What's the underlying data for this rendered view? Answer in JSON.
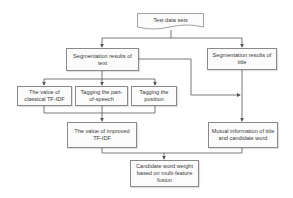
{
  "diagram": {
    "type": "flowchart",
    "nodes": {
      "test_data": {
        "label": "Test data sets",
        "shape": "document"
      },
      "seg_text": {
        "label": "Segmentation results of text"
      },
      "seg_title": {
        "label": "Segmentation results of title"
      },
      "classical_tfidf": {
        "label": "The value of classical TF-IDF"
      },
      "pos_tag": {
        "label": "Tagging the part-of-speech"
      },
      "position_tag": {
        "label": "Tagging the position"
      },
      "improved_tfidf": {
        "label": "The value of improved TF-IDF"
      },
      "mutual_info": {
        "label": "Mutual information of title and candidate word"
      },
      "candidate_weight": {
        "label": "Candidate word weight based on multi-feature fusion"
      }
    },
    "edges": [
      [
        "test_data",
        "seg_text"
      ],
      [
        "test_data",
        "seg_title"
      ],
      [
        "seg_text",
        "classical_tfidf"
      ],
      [
        "seg_text",
        "pos_tag"
      ],
      [
        "seg_text",
        "position_tag"
      ],
      [
        "seg_text",
        "mutual_info"
      ],
      [
        "seg_title",
        "mutual_info"
      ],
      [
        "classical_tfidf",
        "improved_tfidf"
      ],
      [
        "pos_tag",
        "improved_tfidf"
      ],
      [
        "position_tag",
        "improved_tfidf"
      ],
      [
        "improved_tfidf",
        "candidate_weight"
      ],
      [
        "mutual_info",
        "candidate_weight"
      ]
    ],
    "colors": {
      "line": "#555555",
      "border": "#8a8a8a",
      "text": "#3a3a3a"
    }
  }
}
